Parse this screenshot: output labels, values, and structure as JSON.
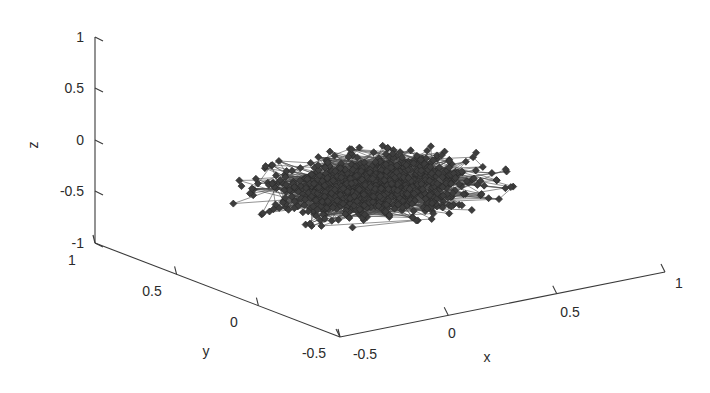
{
  "figure": {
    "background_color": "#ffffff",
    "width": 710,
    "height": 393
  },
  "chart_data": {
    "type": "scatter",
    "subtype": "3d-network-graph",
    "title": "",
    "xlabel": "x",
    "ylabel": "y",
    "zlabel": "z",
    "grid": false,
    "legend": null,
    "projection": "3d",
    "marker": {
      "shape": "diamond",
      "color": "#3d3d3d",
      "edge_color": "#2a2a2a",
      "size": 7
    },
    "edges": {
      "color": "#4a4a4a",
      "width": 0.6,
      "count_approx": 2600
    },
    "node_count_approx": 900,
    "xlim": [
      -0.5,
      1
    ],
    "ylim": [
      -0.5,
      1
    ],
    "zlim": [
      -1,
      1
    ],
    "xticks": [
      -0.5,
      0,
      0.5,
      1
    ],
    "yticks": [
      1,
      0.5,
      0,
      -0.5
    ],
    "zticks": [
      -1,
      -0.5,
      0,
      0.5,
      1
    ],
    "xticklabels": [
      "-0.5",
      "0",
      "0.5",
      "1"
    ],
    "yticklabels": [
      "1",
      "0.5",
      "0",
      "-0.5"
    ],
    "zticklabels": [
      "-1",
      "-0.5",
      "0",
      "0.5",
      "1"
    ],
    "cloud_description": "Dense ellipsoidal cluster of diamond nodes connected by straight edges, flattened in z, centered near origin",
    "cloud_center": [
      0.18,
      0.2,
      -0.25
    ],
    "cloud_radii": [
      0.55,
      0.42,
      0.16
    ],
    "points_note": "Approximately 900 nodes distributed as a flattened ellipsoid cloud; edges connect nearby node pairs"
  },
  "axes": {
    "z": {
      "label": "z",
      "ticks": [
        {
          "value": "1",
          "px": 37
        },
        {
          "value": "0.5",
          "px": 88
        },
        {
          "value": "0",
          "px": 140
        },
        {
          "value": "-0.5",
          "px": 191
        },
        {
          "value": "-1",
          "px": 243
        }
      ]
    },
    "y": {
      "label": "y",
      "ticks": [
        {
          "value": "1",
          "t": 0.0
        },
        {
          "value": "0.5",
          "t": 0.333
        },
        {
          "value": "0",
          "t": 0.667
        },
        {
          "value": "-0.5",
          "t": 1.0
        }
      ]
    },
    "x": {
      "label": "x",
      "ticks": [
        {
          "value": "-0.5",
          "t": 0.0
        },
        {
          "value": "0",
          "t": 0.333
        },
        {
          "value": "0.5",
          "t": 0.667
        },
        {
          "value": "1",
          "t": 1.0
        }
      ]
    }
  },
  "colors": {
    "axis": "#3a3a3a",
    "text": "#2b2b2b",
    "marker": "#3d3d3d",
    "edge": "#4a4a4a",
    "background": "#ffffff"
  }
}
